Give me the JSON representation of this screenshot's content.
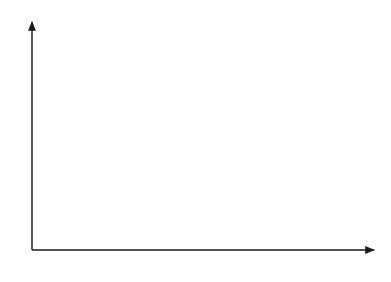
{
  "diagram": {
    "axes": {
      "y_label": "r",
      "x_label": "Y"
    },
    "curves": {
      "LM": {
        "label": "LM"
      },
      "BP": {
        "label": "BP"
      },
      "IS0": {
        "label": "IS",
        "sub": "0"
      },
      "IS1": {
        "label": "IS",
        "sub": "1"
      }
    },
    "points": {
      "A": {
        "label": "A"
      },
      "B": {
        "label": "B"
      },
      "C": {
        "label": "C"
      }
    },
    "y_ticks": [
      {
        "label": "r",
        "sub": "1"
      },
      {
        "label": "r",
        "sub": "0"
      }
    ],
    "x_ticks": [
      {
        "label": "Y",
        "sub": "0"
      },
      {
        "label": "Y",
        "sub": "1"
      }
    ],
    "colors": {
      "line": "#1a1a1a",
      "background": "#ffffff"
    }
  }
}
